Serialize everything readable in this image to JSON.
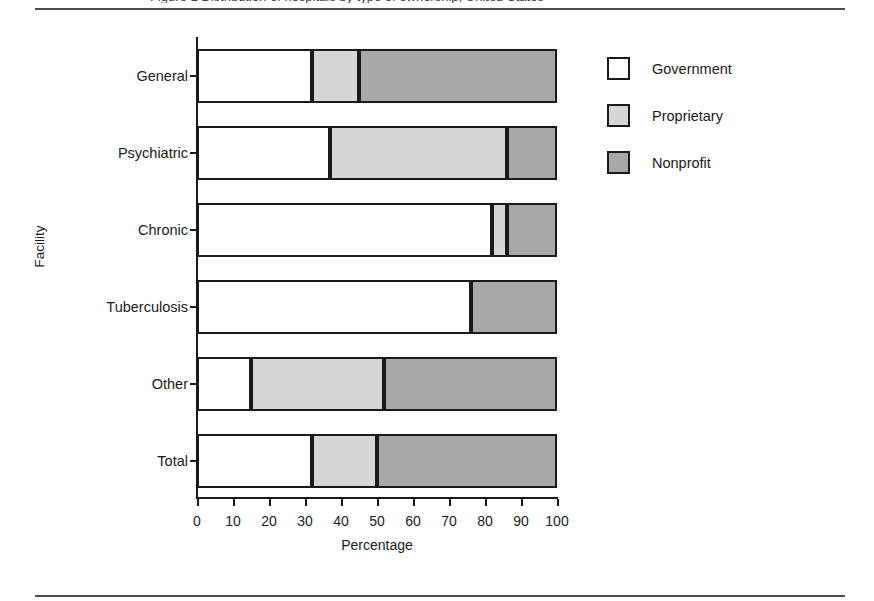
{
  "figure": {
    "caption_fragment": "Figure 1  Distribution of hospitals by type of ownership, United States",
    "y_axis_title": "Facility",
    "x_axis_title": "Percentage"
  },
  "legend": {
    "items": [
      {
        "label": "Government",
        "color": "#ffffff"
      },
      {
        "label": "Proprietary",
        "color": "#d6d6d6"
      },
      {
        "label": "Nonprofit",
        "color": "#a8a8a8"
      }
    ]
  },
  "chart_data": {
    "type": "bar",
    "orientation": "horizontal",
    "stacked": true,
    "title": "",
    "xlabel": "Percentage",
    "ylabel": "Facility",
    "xlim": [
      0,
      100
    ],
    "xticks": [
      0,
      10,
      20,
      30,
      40,
      50,
      60,
      70,
      80,
      90,
      100
    ],
    "grid": false,
    "legend_position": "right",
    "categories": [
      "General",
      "Psychiatric",
      "Chronic",
      "Tuberculosis",
      "Other",
      "Total"
    ],
    "series": [
      {
        "name": "Government",
        "color": "#ffffff",
        "values": [
          32,
          37,
          82,
          76,
          15,
          32
        ]
      },
      {
        "name": "Proprietary",
        "color": "#d6d6d6",
        "values": [
          13,
          49,
          4,
          0,
          37,
          18
        ]
      },
      {
        "name": "Nonprofit",
        "color": "#a8a8a8",
        "values": [
          55,
          14,
          14,
          24,
          48,
          50
        ]
      }
    ]
  }
}
